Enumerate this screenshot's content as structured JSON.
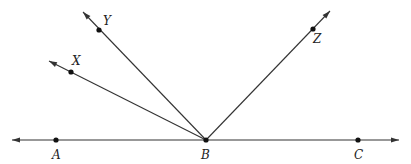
{
  "diagram": {
    "type": "geometry-rays",
    "width": 411,
    "height": 164,
    "stroke_color": "#333333",
    "point_color": "#111111",
    "vertex": {
      "id": "B",
      "x": 206,
      "y": 140,
      "label": "B",
      "label_x": 201,
      "label_y": 159
    },
    "points": [
      {
        "id": "A",
        "label": "A",
        "x": 56,
        "y": 140,
        "label_x": 52,
        "label_y": 159
      },
      {
        "id": "C",
        "label": "C",
        "x": 358,
        "y": 140,
        "label_x": 354,
        "label_y": 159
      },
      {
        "id": "X",
        "label": "X",
        "x": 71,
        "y": 72,
        "label_x": 72,
        "label_y": 65
      },
      {
        "id": "Y",
        "label": "Y",
        "x": 99,
        "y": 30,
        "label_x": 103,
        "label_y": 25
      },
      {
        "id": "Z",
        "label": "Z",
        "x": 313,
        "y": 29,
        "label_x": 313,
        "label_y": 43
      }
    ],
    "rays": [
      {
        "name": "ray-BA",
        "from": "B",
        "through": "A",
        "tip_x": 12,
        "tip_y": 140
      },
      {
        "name": "ray-BC",
        "from": "B",
        "through": "C",
        "tip_x": 399,
        "tip_y": 140
      },
      {
        "name": "ray-BX",
        "from": "B",
        "through": "X",
        "tip_x": 49,
        "tip_y": 61
      },
      {
        "name": "ray-BY",
        "from": "B",
        "through": "Y",
        "tip_x": 83,
        "tip_y": 12
      },
      {
        "name": "ray-BZ",
        "from": "B",
        "through": "Z",
        "tip_x": 330,
        "tip_y": 11
      }
    ]
  }
}
